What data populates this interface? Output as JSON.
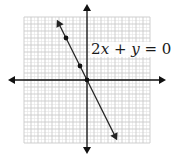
{
  "chart_data": {
    "type": "line",
    "title": "",
    "xlabel": "",
    "ylabel": "",
    "xlim": [
      -9,
      9
    ],
    "ylim": [
      -9,
      9
    ],
    "grid": true,
    "grid_major_step": 1,
    "grid_minor_step": 0.5,
    "legend": null,
    "axes_arrows": true,
    "series": [
      {
        "name": "2x + y = 0",
        "equation": "2x + y = 0",
        "slope": -2,
        "intercept": 0,
        "line_start": [
          -4.3,
          8.6
        ],
        "line_end": [
          4.3,
          -8.6
        ],
        "arrowheads": "both",
        "marked_points": [
          [
            -3,
            6
          ],
          [
            -1,
            2
          ],
          [
            0,
            0
          ]
        ]
      }
    ],
    "annotations": [
      {
        "text": "2x + y = 0",
        "position": [
          0.3,
          4.5
        ]
      }
    ]
  },
  "equation_label": {
    "coef": "2",
    "var_x": "x",
    "plus": " + ",
    "var_y": "y",
    "equals": " = ",
    "rhs": "0"
  },
  "colors": {
    "axis": "#111111",
    "line": "#222222",
    "point": "#111111",
    "grid_major": "#c8c8c8",
    "grid_minor": "#e4e4e4",
    "background": "#ffffff"
  },
  "layout": {
    "origin_px": [
      87,
      80
    ],
    "unit_px": 7
  }
}
